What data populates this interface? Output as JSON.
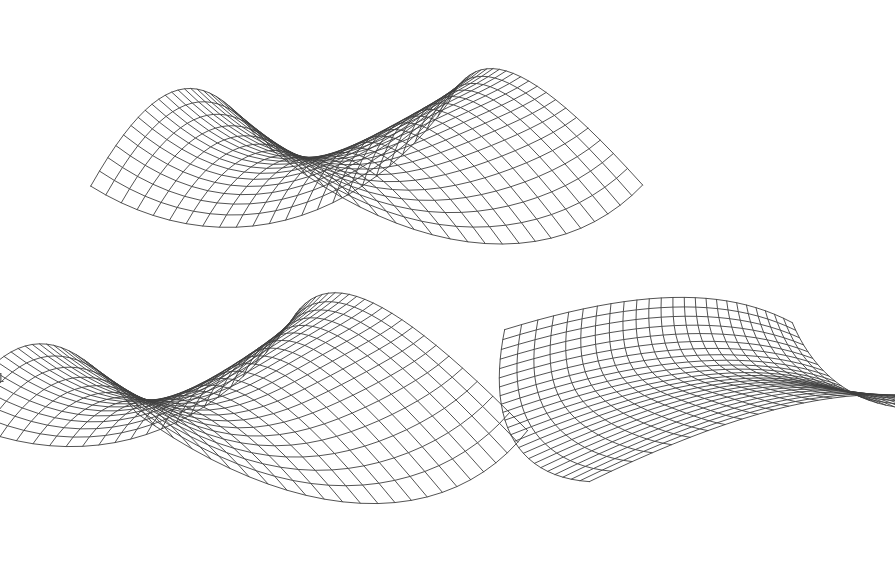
{
  "figure": {
    "background_color": "#ffffff",
    "line_color": "#404040",
    "line_width": 0.9,
    "width": 895,
    "height": 572,
    "panel_count": 3
  },
  "labels": {
    "clipped_left_top": ",",
    "clipped_left_bottom": "1"
  },
  "chart_data": {
    "type": "line",
    "subtitle": "Same parametric surface rendered at three viewing orientations",
    "xlabel": "",
    "ylabel": "",
    "grid": false,
    "legend": false,
    "surface_equation": "z = a*x^2 - b*y^2 + c*x*y  (hyperbolic / monkey-saddle family)",
    "domain_u": [
      -1,
      1
    ],
    "domain_v": [
      -1,
      1
    ],
    "mesh_rows": 24,
    "mesh_cols": 24,
    "hidden_line_removal": false,
    "panels": [
      {
        "name": "panel-top-center",
        "index": 0,
        "center_x": 360,
        "center_y": 148,
        "scale_x": 200,
        "scale_y": 150,
        "scale_z": 118,
        "yaw_deg": 24,
        "pitch_deg": 8,
        "roll_deg": -4,
        "bbox": [
          192,
          28,
          512,
          272
        ],
        "coeff_a": 1.0,
        "coeff_b": 1.05,
        "coeff_c": 0.45,
        "warp": 0.22
      },
      {
        "name": "panel-bottom-left",
        "index": 1,
        "center_x": 228,
        "center_y": 388,
        "scale_x": 205,
        "scale_y": 150,
        "scale_z": 128,
        "yaw_deg": 26,
        "pitch_deg": 26,
        "roll_deg": -6,
        "bbox": [
          28,
          268,
          440,
          506
        ],
        "coeff_a": 1.0,
        "coeff_b": 1.05,
        "coeff_c": 0.45,
        "warp": 0.22
      },
      {
        "name": "panel-bottom-right",
        "index": 2,
        "center_x": 712,
        "center_y": 378,
        "scale_x": 178,
        "scale_y": 192,
        "scale_z": 110,
        "yaw_deg": -56,
        "pitch_deg": 58,
        "roll_deg": 14,
        "bbox": [
          500,
          196,
          870,
          556
        ],
        "coeff_a": 1.0,
        "coeff_b": 1.05,
        "coeff_c": 0.45,
        "warp": 0.22
      }
    ]
  }
}
